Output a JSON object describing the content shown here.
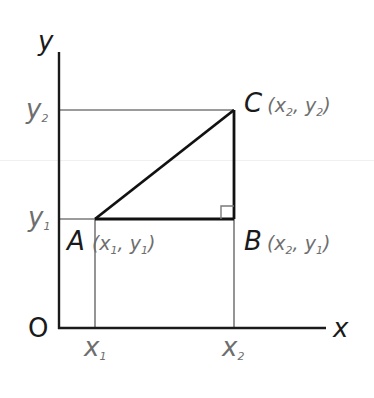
{
  "diagram": {
    "type": "coordinate-geometry",
    "axes": {
      "x_label": "x",
      "y_label": "y",
      "origin_label": "O"
    },
    "ticks": {
      "x": [
        {
          "base": "x",
          "sub": "1"
        },
        {
          "base": "x",
          "sub": "2"
        }
      ],
      "y": [
        {
          "base": "y",
          "sub": "1"
        },
        {
          "base": "y",
          "sub": "2"
        }
      ]
    },
    "points": [
      {
        "name": "A",
        "coords": "(x1, y1)",
        "x_sub": "1",
        "y_sub": "1"
      },
      {
        "name": "B",
        "coords": "(x2, y1)",
        "x_sub": "2",
        "y_sub": "1"
      },
      {
        "name": "C",
        "coords": "(x2, y2)",
        "x_sub": "2",
        "y_sub": "2"
      }
    ],
    "right_angle_at": "B",
    "colors": {
      "axis": "#1a1a1a",
      "triangle": "#111111",
      "guides": "#7a7a7a",
      "labels_gray": "#6e6e6e"
    }
  },
  "text": {
    "x": "x",
    "y": "y",
    "O": "O",
    "A": "A",
    "B": "B",
    "C": "C",
    "paren_open": "(",
    "paren_close": ")",
    "comma": ", ",
    "xs": "x",
    "ys": "y",
    "one": "1",
    "two": "2"
  }
}
